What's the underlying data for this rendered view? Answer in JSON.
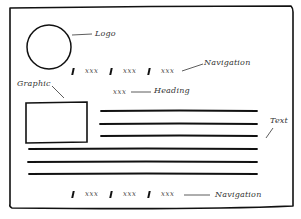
{
  "wireframe": {
    "colors": {
      "ink": "#111111",
      "annotation": "#333333",
      "background": "#ffffff"
    },
    "logo": {
      "label": "Logo",
      "shape": "circle"
    },
    "top_navigation": {
      "items": [
        "xxx",
        "xxx",
        "xxx"
      ],
      "separator": "|",
      "annotation": "Navigation"
    },
    "heading": {
      "placeholder": "xxx",
      "annotation": "Heading"
    },
    "graphic": {
      "annotation": "Graphic",
      "shape": "rectangle"
    },
    "text_block": {
      "line_count": 6,
      "annotation": "Text"
    },
    "bottom_navigation": {
      "items": [
        "xxx",
        "xxx",
        "xxx"
      ],
      "separator": "|",
      "annotation": "Navigation"
    }
  }
}
